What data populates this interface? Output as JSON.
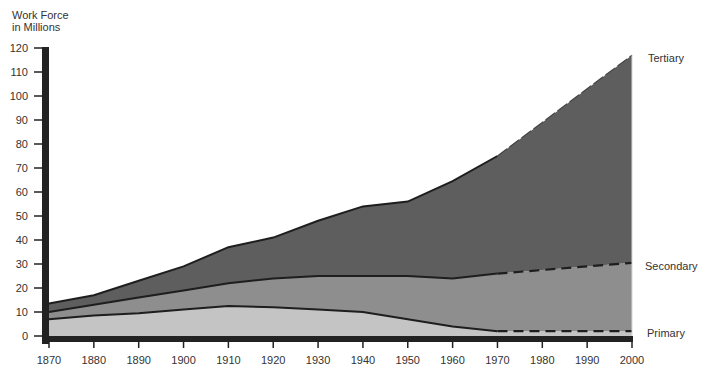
{
  "chart_data": {
    "type": "area",
    "stacked": true,
    "title": "",
    "ylabel": "Work Force in Millions",
    "ylabel_lines": [
      "Work Force",
      "in Millions"
    ],
    "xlabel": "",
    "x": [
      1870,
      1880,
      1890,
      1900,
      1910,
      1920,
      1930,
      1940,
      1950,
      1960,
      1970,
      1980,
      1990,
      2000
    ],
    "xlim": [
      1870,
      2000
    ],
    "ylim": [
      0,
      120
    ],
    "yticks": [
      0,
      10,
      20,
      30,
      40,
      50,
      60,
      70,
      80,
      90,
      100,
      110,
      120
    ],
    "xticks": [
      1870,
      1880,
      1890,
      1900,
      1910,
      1920,
      1930,
      1940,
      1950,
      1960,
      1970,
      1980,
      1990,
      2000
    ],
    "projection_start": 1970,
    "grid": false,
    "legend_position": "right (direct labels)",
    "series": [
      {
        "name": "Primary",
        "color": "#c4c4c4",
        "values": [
          7,
          8.5,
          9.5,
          11,
          12.5,
          12,
          11,
          10,
          7,
          4,
          2,
          2,
          2,
          2
        ]
      },
      {
        "name": "Secondary",
        "color": "#8e8e8e",
        "values": [
          3,
          4.5,
          6.5,
          8,
          9.5,
          12,
          14,
          15,
          18,
          20,
          24,
          25.5,
          27,
          28.5
        ]
      },
      {
        "name": "Tertiary",
        "color": "#5e5e5e",
        "values": [
          3.5,
          4,
          7,
          10,
          15,
          17,
          23,
          29,
          31,
          40.5,
          49,
          61.5,
          74,
          86.5
        ]
      }
    ],
    "cumulative_upper": {
      "Primary": [
        7,
        8.5,
        9.5,
        11,
        12.5,
        12,
        11,
        10,
        7,
        4,
        2,
        2,
        2,
        2
      ],
      "Secondary": [
        10,
        13,
        16,
        19,
        22,
        24,
        25,
        25,
        25,
        24,
        26,
        27.5,
        29,
        30.5
      ],
      "Tertiary": [
        13.5,
        17,
        23,
        29,
        37,
        41,
        48,
        54,
        56,
        64.5,
        75,
        89,
        103,
        117
      ]
    }
  },
  "labels": {
    "ylabel_line1": "Work Force",
    "ylabel_line2": "in Millions",
    "tertiary": "Tertiary",
    "secondary": "Secondary",
    "primary": "Primary"
  }
}
